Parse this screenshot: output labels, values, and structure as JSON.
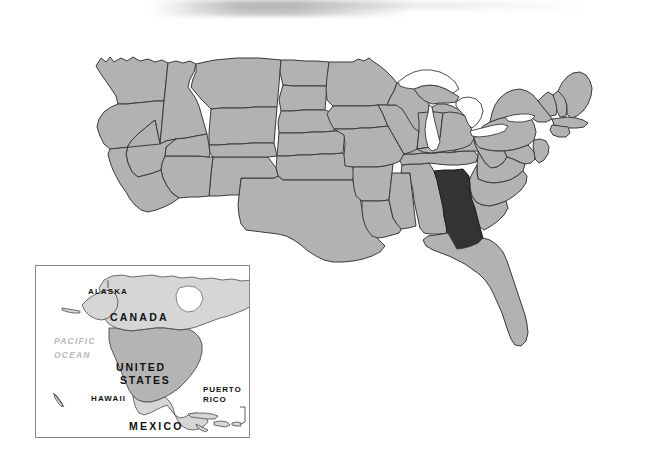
{
  "page": {
    "width": 656,
    "height": 465,
    "background_color": "#ffffff"
  },
  "main_map": {
    "name": "united-states-map",
    "region": "Contiguous United States",
    "land_fill_color": "#b2b2b2",
    "border_color": "#3a3a3a",
    "water_fill_color": "#ffffff",
    "highlight_fill_color": "#333333",
    "highlighted_state": "Georgia",
    "great_lakes": [
      "Lake Superior",
      "Lake Michigan",
      "Lake Huron",
      "Lake Erie",
      "Lake Ontario"
    ]
  },
  "inset": {
    "name": "north-america-inset",
    "border_color": "#8a8a8a",
    "ocean_fill_color": "#ffffff",
    "land_fill_color": "#d6d6d6",
    "country_fill_color": "#b4b4b4",
    "labels": {
      "canada": "CANADA",
      "united_states_line1": "UNITED",
      "united_states_line2": "STATES",
      "mexico": "MEXICO",
      "alaska": "ALASKA",
      "hawaii": "HAWAII",
      "puerto_rico_line1": "PUERTO",
      "puerto_rico_line2": "RICO",
      "pacific_ocean_line1": "PACIFIC",
      "pacific_ocean_line2": "OCEAN"
    }
  }
}
